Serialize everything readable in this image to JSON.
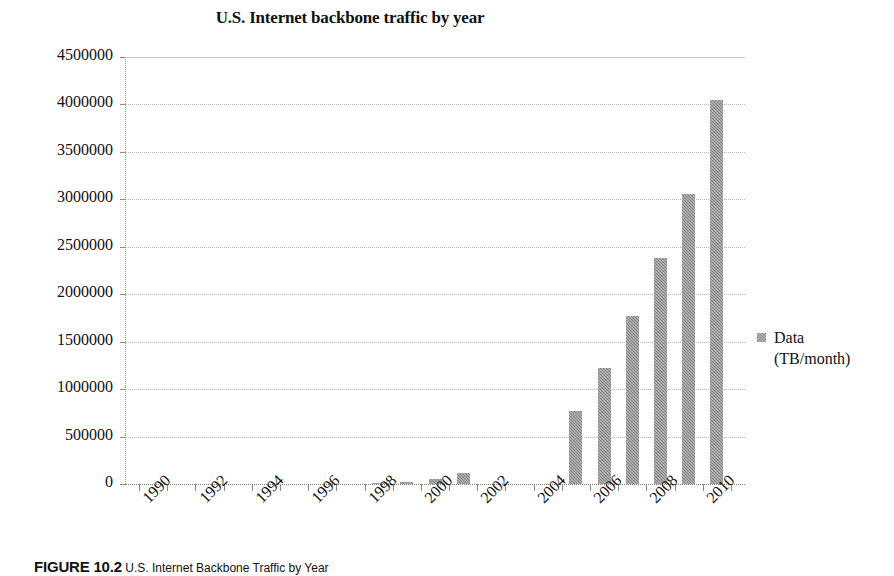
{
  "chart_data": {
    "type": "bar",
    "title": "U.S. Internet backbone traffic by year",
    "xlabel": "",
    "ylabel": "",
    "ylim": [
      0,
      4500000
    ],
    "ytick_step": 500000,
    "grid": true,
    "legend_position": "right",
    "series": [
      {
        "name": "Data (TB/month)",
        "values": [
          0,
          0,
          0,
          0,
          0,
          0,
          0,
          0,
          6000,
          16000,
          56000,
          120000,
          0,
          0,
          0,
          770000,
          1220000,
          1770000,
          2380000,
          3060000,
          4050000
        ]
      }
    ],
    "categories": [
      1990,
      1991,
      1992,
      1993,
      1994,
      1995,
      1996,
      1997,
      1998,
      1999,
      2000,
      2001,
      2002,
      2003,
      2004,
      2005,
      2006,
      2007,
      2008,
      2009,
      2010
    ],
    "x": [
      1990,
      1991,
      1992,
      1993,
      1994,
      1995,
      1996,
      1997,
      1998,
      1999,
      2000,
      2001,
      2002,
      2003,
      2004,
      2005,
      2006,
      2007,
      2008,
      2009,
      2010
    ],
    "ytick_labels": [
      "4500000",
      "4000000",
      "3500000",
      "3000000",
      "2500000",
      "2000000",
      "1500000",
      "1000000",
      "500000",
      "0"
    ],
    "ytick_values": [
      4500000,
      4000000,
      3500000,
      3000000,
      2500000,
      2000000,
      1500000,
      1000000,
      500000,
      0
    ],
    "xtick_labels": [
      "1990",
      "1992",
      "1994",
      "1996",
      "1998",
      "2000",
      "2002",
      "2004",
      "2006",
      "2008",
      "2010"
    ],
    "xtick_values": [
      1990,
      1992,
      1994,
      1996,
      1998,
      2000,
      2002,
      2004,
      2006,
      2008,
      2010
    ],
    "bar_color": "#878787",
    "grid_color": "#b9b9b9"
  },
  "legend": {
    "line1": "Data",
    "line2": "(TB/month)"
  },
  "caption": {
    "label": "FIGURE 10.2",
    "text": "U.S. Internet Backbone Traffic by Year"
  }
}
